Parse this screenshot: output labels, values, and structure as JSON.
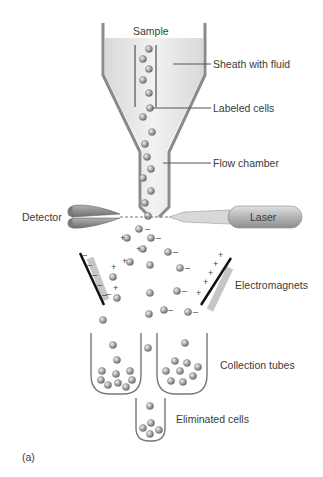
{
  "diagram": {
    "panel_label": "(a)",
    "labels": {
      "sample": "Sample",
      "sheath": "Sheath with fluid",
      "labeled_cells": "Labeled cells",
      "flow_chamber": "Flow chamber",
      "detector": "Detector",
      "laser": "Laser",
      "electromagnets": "Electromagnets",
      "collection_tubes": "Collection tubes",
      "eliminated_cells": "Eliminated cells"
    },
    "charges": {
      "positive": "+",
      "negative": "–"
    },
    "colors": {
      "chamber_wall": "#8a8a8a",
      "fluid": "#e6e6e6",
      "cell": "#9a9a9a",
      "electrode": "#111111",
      "magnet_body": "#c4c4c4",
      "laser_body": "#bdbdbd",
      "text": "#3a3a3a"
    }
  }
}
